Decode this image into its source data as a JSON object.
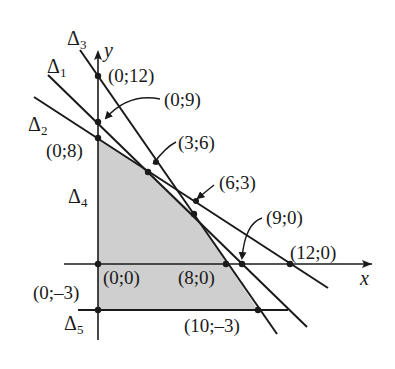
{
  "diagram": {
    "type": "linear-programming-feasible-region",
    "colors": {
      "line": "#1a1a1a",
      "fill": "#cfcfcf",
      "background": "#ffffff"
    },
    "axes": {
      "x_label": "x",
      "y_label": "y"
    },
    "lines": [
      {
        "name": "Δ",
        "sub": "1",
        "through": [
          "(0;9)",
          "(9;0)"
        ]
      },
      {
        "name": "Δ",
        "sub": "2",
        "through": [
          "(0;8)",
          "(12;0)"
        ]
      },
      {
        "name": "Δ",
        "sub": "3",
        "through": [
          "(0;12)",
          "(8;0)"
        ]
      },
      {
        "name": "Δ",
        "sub": "4",
        "note": "y-axis (x=0)"
      },
      {
        "name": "Δ",
        "sub": "5",
        "note": "y=-3"
      }
    ],
    "points": {
      "p0_12": "(0;12)",
      "p0_9": "(0;9)",
      "p0_8": "(0;8)",
      "p3_6": "(3;6)",
      "p6_3": "(6;3)",
      "p9_0": "(9;0)",
      "p12_0": "(12;0)",
      "p0_0": "(0;0)",
      "p8_0": "(8;0)",
      "p0_m3": "(0;–3)",
      "p10_m3": "(10;–3)"
    },
    "feasible_region_vertices": [
      "(0;8)",
      "(3;6)",
      "(6;3)",
      "(10;–3)",
      "(0;–3)"
    ]
  }
}
